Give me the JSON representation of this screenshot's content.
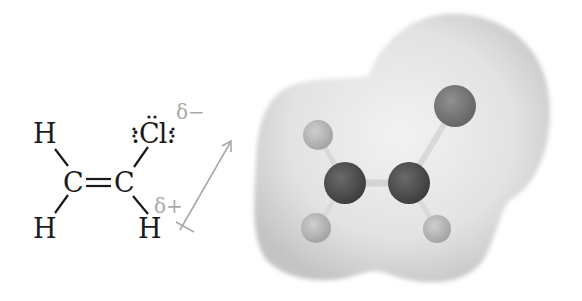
{
  "figure": {
    "structural_formula": {
      "atoms": [
        {
          "id": "h1",
          "symbol": "H",
          "position": "top-left"
        },
        {
          "id": "c1",
          "symbol": "C",
          "position": "left-carbon"
        },
        {
          "id": "h2",
          "symbol": "H",
          "position": "bottom-left"
        },
        {
          "id": "c2",
          "symbol": "C",
          "position": "right-carbon"
        },
        {
          "id": "cl",
          "symbol": ":Cl:",
          "position": "top-right",
          "lone_pairs": 3
        },
        {
          "id": "h3",
          "symbol": "H",
          "position": "bottom-right"
        }
      ],
      "bonds": [
        {
          "from": "h1",
          "to": "c1",
          "order": 1
        },
        {
          "from": "h2",
          "to": "c1",
          "order": 1
        },
        {
          "from": "c1",
          "to": "c2",
          "order": 2
        },
        {
          "from": "c2",
          "to": "cl",
          "order": 1
        },
        {
          "from": "c2",
          "to": "h3",
          "order": 1
        }
      ],
      "partial_charges": {
        "negative": "δ−",
        "positive": "δ+"
      },
      "dipole_arrow": {
        "direction": "from δ+ (H) toward δ− (Cl)",
        "color": "#a9a9a9"
      }
    },
    "space_model": {
      "surface_color": "#e4e4e4",
      "atoms": [
        {
          "element": "Cl",
          "color": "#7a7a7a"
        },
        {
          "element": "H",
          "color": "#bdbdbd"
        },
        {
          "element": "C",
          "color": "#505050"
        },
        {
          "element": "C",
          "color": "#505050"
        },
        {
          "element": "H",
          "color": "#bdbdbd"
        },
        {
          "element": "H",
          "color": "#bdbdbd"
        }
      ]
    }
  }
}
